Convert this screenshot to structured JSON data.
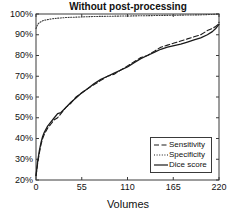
{
  "chart_data": {
    "type": "line",
    "title": "Without post-processing",
    "xlabel": "Volumes",
    "ylabel": "",
    "xlim": [
      0,
      220
    ],
    "ylim": [
      20,
      100
    ],
    "grid": false,
    "legend_position": "lower-right",
    "xticks": [
      0,
      55,
      110,
      165,
      220
    ],
    "xticklabels": [
      "0",
      "55",
      "110",
      "165",
      "220"
    ],
    "yticks": [
      20,
      30,
      40,
      50,
      60,
      70,
      80,
      90,
      100
    ],
    "yticklabels": [
      "20%",
      "30%",
      "40%",
      "50%",
      "60%",
      "70%",
      "80%",
      "90%",
      "100%"
    ],
    "x": [
      0,
      2,
      4,
      6,
      8,
      10,
      14,
      18,
      22,
      26,
      30,
      36,
      42,
      48,
      55,
      62,
      70,
      78,
      86,
      94,
      102,
      110,
      118,
      126,
      134,
      142,
      150,
      158,
      166,
      174,
      182,
      190,
      198,
      206,
      212,
      216,
      219,
      220
    ],
    "series": [
      {
        "name": "Sensitivity",
        "style": "dashed",
        "color": "#1a1a1a",
        "values": [
          22,
          28,
          33,
          37,
          40,
          42,
          45,
          47,
          49,
          50,
          52,
          55,
          57,
          60,
          62,
          64,
          66,
          68,
          70,
          71,
          73,
          75,
          77,
          79,
          80,
          82,
          84,
          85,
          86,
          87,
          88,
          89,
          90,
          92,
          93,
          94,
          95,
          96
        ]
      },
      {
        "name": "Specificity",
        "style": "dotted",
        "color": "#3a3a3a",
        "values": [
          93,
          95,
          95.8,
          96.3,
          96.7,
          97,
          97.3,
          97.6,
          97.8,
          98,
          98.1,
          98.3,
          98.4,
          98.5,
          98.6,
          98.7,
          98.8,
          98.85,
          98.9,
          98.95,
          99,
          99.05,
          99.1,
          99.15,
          99.2,
          99.25,
          99.3,
          99.35,
          99.4,
          99.45,
          99.5,
          99.55,
          99.6,
          99.7,
          99.8,
          99.9,
          99.95,
          100
        ]
      },
      {
        "name": "Dice score",
        "style": "solid",
        "color": "#1a1a1a",
        "values": [
          22,
          29,
          34,
          38,
          41,
          43,
          46,
          48,
          50,
          52,
          52.5,
          55,
          57.5,
          59.5,
          62,
          64,
          66.5,
          68.5,
          70,
          71.5,
          73,
          74.5,
          76.5,
          78.5,
          80,
          81.5,
          83,
          84,
          84.8,
          85.5,
          86.5,
          87.5,
          88.5,
          90,
          91.5,
          93,
          94.5,
          95
        ]
      }
    ],
    "legend": [
      {
        "label": "Sensitivity",
        "style": "dashed"
      },
      {
        "label": "Specificity",
        "style": "dotted"
      },
      {
        "label": "Dice score",
        "style": "solid"
      }
    ]
  }
}
